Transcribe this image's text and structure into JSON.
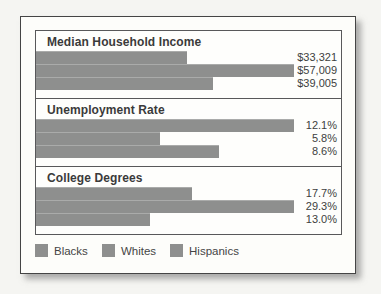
{
  "page": {
    "background": "#f5f5f2"
  },
  "card": {
    "background": "#fdfdfa",
    "border_color": "#454545"
  },
  "panel": {
    "border_color": "#58585a"
  },
  "colors": {
    "bar": "#8e8f8e",
    "section_title_text": "#3a3a3a",
    "value_text": "#3d3e3e",
    "legend_text": "#454545"
  },
  "chart_data": {
    "type": "bar",
    "orientation": "horizontal",
    "series_order": [
      "Blacks",
      "Whites",
      "Hispanics"
    ],
    "sections": [
      {
        "title": "Median Household Income",
        "labels": [
          "$33,321",
          "$57,009",
          "$39,005"
        ],
        "values": [
          33321,
          57009,
          39005
        ]
      },
      {
        "title": "Unemployment Rate",
        "labels": [
          "12.1%",
          "5.8%",
          "8.6%"
        ],
        "values": [
          12.1,
          5.8,
          8.6
        ]
      },
      {
        "title": "College Degrees",
        "labels": [
          "17.7%",
          "29.3%",
          "13.0%"
        ],
        "values": [
          17.7,
          29.3,
          13.0
        ]
      }
    ],
    "legend": [
      "Blacks",
      "Whites",
      "Hispanics"
    ],
    "legend_position": "bottom-left",
    "grid": false,
    "max_bar_px": 258
  }
}
